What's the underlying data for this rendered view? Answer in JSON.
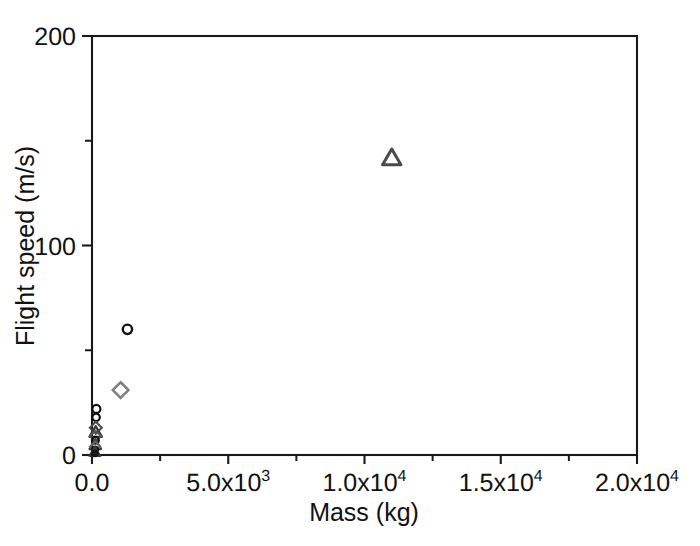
{
  "chart_data": {
    "type": "scatter",
    "title": "",
    "xlabel": "Mass (kg)",
    "ylabel": "Flight speed (m/s)",
    "xlim": [
      0,
      20000
    ],
    "ylim": [
      0,
      200
    ],
    "grid": false,
    "legend": "none",
    "x_ticks": [
      {
        "value": 0,
        "label_mantissa": "0.0",
        "label_base": "",
        "label_exp": ""
      },
      {
        "value": 5000,
        "label_mantissa": "5.0x10",
        "label_base": "",
        "label_exp": "3"
      },
      {
        "value": 10000,
        "label_mantissa": "1.0x10",
        "label_base": "",
        "label_exp": "4"
      },
      {
        "value": 15000,
        "label_mantissa": "1.5x10",
        "label_base": "",
        "label_exp": "4"
      },
      {
        "value": 20000,
        "label_mantissa": "2.0x10",
        "label_base": "",
        "label_exp": "4"
      }
    ],
    "x_minor_ticks": [
      2500,
      7500,
      12500,
      17500
    ],
    "y_ticks": [
      {
        "value": 0,
        "label": "0"
      },
      {
        "value": 100,
        "label": "100"
      },
      {
        "value": 200,
        "label": "200"
      }
    ],
    "y_minor_ticks": [
      50,
      150
    ],
    "series": [
      {
        "name": "circles",
        "marker": "circle",
        "color": "#111111",
        "points": [
          {
            "x": 11000,
            "y": 142,
            "marker": "triangle",
            "color": "#4a4a4a",
            "size": 9.5
          },
          {
            "x": 1300,
            "y": 60,
            "marker": "circle",
            "color": "#111111",
            "size": 7.5
          },
          {
            "x": 1050,
            "y": 31,
            "marker": "diamond",
            "color": "#808080",
            "size": 8.5
          },
          {
            "x": 160,
            "y": 22,
            "marker": "circle",
            "color": "#111111",
            "size": 6.5
          },
          {
            "x": 150,
            "y": 18,
            "marker": "circle",
            "color": "#111111",
            "size": 6.0
          },
          {
            "x": 140,
            "y": 13,
            "marker": "diamond",
            "color": "#4a4a4a",
            "size": 6.5
          },
          {
            "x": 135,
            "y": 11,
            "marker": "triangle",
            "color": "#3a3a3a",
            "size": 6.5
          },
          {
            "x": 130,
            "y": 9,
            "marker": "diamond",
            "color": "#555555",
            "size": 6.0
          },
          {
            "x": 125,
            "y": 7,
            "marker": "circle",
            "color": "#111111",
            "size": 5.5
          },
          {
            "x": 120,
            "y": 5,
            "marker": "triangle",
            "color": "#3a3a3a",
            "size": 6.0
          },
          {
            "x": 115,
            "y": 4,
            "marker": "diamond",
            "color": "#666666",
            "size": 5.5
          },
          {
            "x": 110,
            "y": 2.5,
            "marker": "circle",
            "color": "#111111",
            "size": 5.0
          },
          {
            "x": 105,
            "y": 1.5,
            "marker": "triangle",
            "color": "#3a3a3a",
            "size": 5.5
          },
          {
            "x": 100,
            "y": 0.8,
            "marker": "circle",
            "color": "#111111",
            "size": 4.5
          }
        ]
      }
    ],
    "marker_styles": {
      "circle": "open circle, black outline",
      "diamond": "open diamond, gray outline",
      "triangle": "open triangle, dark gray outline"
    }
  },
  "axis_colors": {
    "frame": "#1a1a1a",
    "text": "#111111"
  }
}
